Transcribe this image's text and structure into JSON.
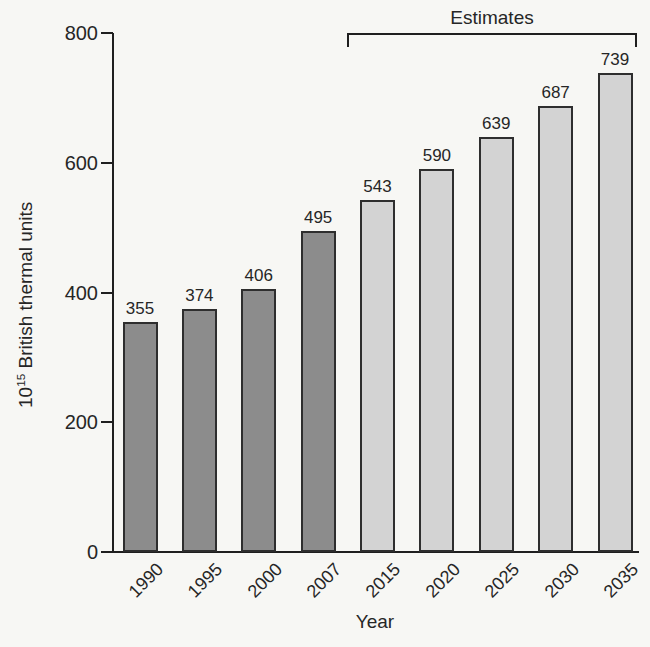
{
  "chart_data": {
    "type": "bar",
    "title": "",
    "xlabel": "Year",
    "ylabel_base": "10",
    "ylabel_exponent": "15",
    "ylabel_rest": " British thermal units",
    "ylabel_text": "10^15 British thermal units",
    "categories": [
      "1990",
      "1995",
      "2000",
      "2007",
      "2015",
      "2020",
      "2025",
      "2030",
      "2035"
    ],
    "values": [
      355,
      374,
      406,
      495,
      543,
      590,
      639,
      687,
      739
    ],
    "estimate_flags": [
      false,
      false,
      false,
      false,
      true,
      true,
      true,
      true,
      true
    ],
    "annotation": "Estimates",
    "y_ticks": [
      0,
      200,
      400,
      600,
      800
    ],
    "ylim": [
      0,
      800
    ],
    "grid": false,
    "legend": "none",
    "colors": {
      "historical_bar": "#8c8c8c",
      "estimate_bar": "#d3d3d3",
      "bar_border": "#2e2e2e",
      "axis": "#1f1f1f",
      "text": "#262626",
      "background": "#f7f7f4"
    }
  }
}
